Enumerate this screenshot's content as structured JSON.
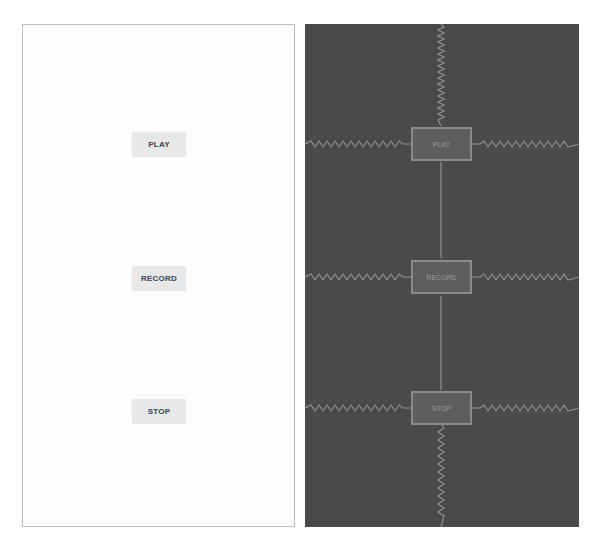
{
  "design_view": {
    "buttons": [
      {
        "label": "PLAY"
      },
      {
        "label": "RECORD"
      },
      {
        "label": "STOP"
      }
    ]
  },
  "blueprint_view": {
    "buttons": [
      {
        "label": "PLAY"
      },
      {
        "label": "RECORD"
      },
      {
        "label": "STOP"
      }
    ]
  },
  "colors": {
    "design_bg": "#fdfdfd",
    "blueprint_bg": "#4a4a4a",
    "button_bg": "#e8e8e8",
    "constraint_line": "#8f8f8f"
  }
}
